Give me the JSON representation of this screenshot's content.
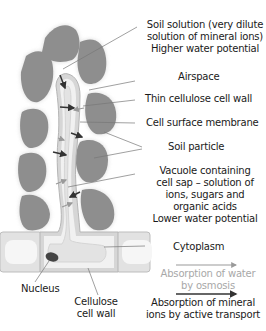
{
  "labels": {
    "soil_solution": [
      "Soil solution (very dilute",
      "solution of mineral ions)",
      "Higher water potential"
    ],
    "airspace": "Airspace",
    "cell_wall_thin": "Thin cellulose cell wall",
    "membrane": "Cell surface membrane",
    "soil_particle": "Soil particle",
    "vacuole": [
      "Vacuole containing",
      "cell sap – solution of",
      "ions, sugars and",
      "organic acids",
      "Lower water potential"
    ],
    "cytoplasm": "Cytoplasm",
    "nucleus": "Nucleus",
    "cellulose_wall": [
      "Cellulose",
      "cell wall"
    ]
  },
  "legend": {
    "water": {
      "text": [
        "Absorption of water",
        "by osmosis"
      ],
      "color": "#a8a8a8"
    },
    "mineral": {
      "text": [
        "Absorption of mineral",
        "ions by active transport"
      ],
      "color": "#333333"
    }
  },
  "colors": {
    "soil_particle": "#8e8e8e",
    "cell_wall": "#d6d6d6",
    "cytoplasm": "#f2f2f2",
    "vacuole": "#e4e4e4",
    "nucleus": "#444444",
    "leader_line": "#666666"
  }
}
